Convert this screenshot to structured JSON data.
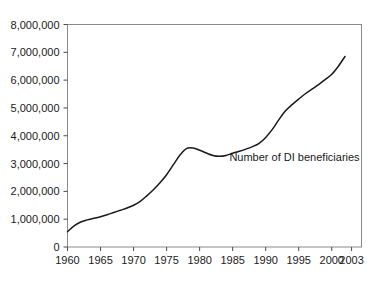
{
  "chart_data": {
    "type": "line",
    "title": "",
    "subtitle": "",
    "xlabel": "",
    "ylabel": "",
    "xlim": [
      1960,
      2004.5
    ],
    "ylim": [
      0,
      8000000
    ],
    "grid": false,
    "legend_position": "none",
    "annotations": [
      {
        "text": "Number of DI beneficiaries",
        "x": 1984.5,
        "y": 3080000
      }
    ],
    "x_tick_labels": [
      "1960",
      "1965",
      "1970",
      "1975",
      "1980",
      "1985",
      "1990",
      "1995",
      "2000",
      "2003"
    ],
    "x_tick_values": [
      1960,
      1965,
      1970,
      1975,
      1980,
      1985,
      1990,
      1995,
      2000,
      2003
    ],
    "y_tick_labels": [
      "0",
      "1,000,000",
      "2,000,000",
      "3,000,000",
      "4,000,000",
      "5,000,000",
      "6,000,000",
      "7,000,000",
      "8,000,000"
    ],
    "y_tick_values": [
      0,
      1000000,
      2000000,
      3000000,
      4000000,
      5000000,
      6000000,
      7000000,
      8000000
    ],
    "series": [
      {
        "name": "Number of DI beneficiaries",
        "color": "#1a1a1a",
        "x": [
          1960,
          1961,
          1962,
          1963,
          1964,
          1965,
          1966,
          1967,
          1968,
          1969,
          1970,
          1971,
          1972,
          1973,
          1974,
          1975,
          1976,
          1977,
          1978,
          1979,
          1980,
          1981,
          1982,
          1983,
          1984,
          1985,
          1986,
          1987,
          1988,
          1989,
          1990,
          1991,
          1992,
          1993,
          1994,
          1995,
          1996,
          1997,
          1998,
          1999,
          2000,
          2001,
          2002
        ],
        "values": [
          550000,
          760000,
          900000,
          975000,
          1030000,
          1090000,
          1160000,
          1240000,
          1320000,
          1400000,
          1500000,
          1640000,
          1840000,
          2060000,
          2310000,
          2600000,
          2950000,
          3300000,
          3540000,
          3560000,
          3480000,
          3380000,
          3290000,
          3260000,
          3290000,
          3370000,
          3440000,
          3520000,
          3610000,
          3730000,
          3940000,
          4230000,
          4580000,
          4900000,
          5120000,
          5320000,
          5510000,
          5680000,
          5840000,
          6020000,
          6210000,
          6500000,
          6850000
        ]
      }
    ]
  },
  "axis": {
    "ytick_labels": [
      "8,000,000",
      "7,000,000",
      "6,000,000",
      "5,000,000",
      "4,000,000",
      "3,000,000",
      "2,000,000",
      "1,000,000",
      "0"
    ],
    "xtick_labels": [
      "1960",
      "1965",
      "1970",
      "1975",
      "1980",
      "1985",
      "1990",
      "1995",
      "2000",
      "2003"
    ]
  },
  "annotation": {
    "text": "Number of DI beneficiaries"
  },
  "colors": {
    "line": "#1a1a1a",
    "frame": "#8a8a8a",
    "tick": "#4a4a4a",
    "text": "#1a1a1a",
    "background": "#ffffff"
  }
}
